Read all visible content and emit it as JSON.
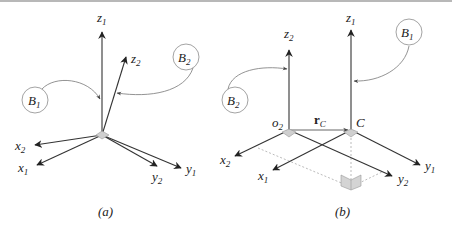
{
  "figure": {
    "panels": [
      {
        "id": "a",
        "caption": "(a)",
        "bodies": [
          {
            "label": "B",
            "sub": "1"
          },
          {
            "label": "B",
            "sub": "2"
          }
        ],
        "axes": {
          "z1": {
            "label": "z",
            "sub": "1"
          },
          "z2": {
            "label": "z",
            "sub": "2"
          },
          "x1": {
            "label": "x",
            "sub": "1"
          },
          "x2": {
            "label": "x",
            "sub": "2"
          },
          "y1": {
            "label": "y",
            "sub": "1"
          },
          "y2": {
            "label": "y",
            "sub": "2"
          }
        }
      },
      {
        "id": "b",
        "caption": "(b)",
        "bodies": [
          {
            "label": "B",
            "sub": "1"
          },
          {
            "label": "B",
            "sub": "2"
          }
        ],
        "points": {
          "o2": {
            "label": "o",
            "sub": "2"
          },
          "C": {
            "label": "C"
          }
        },
        "vector": {
          "label": "r",
          "sub": "C"
        },
        "axes": {
          "z1": {
            "label": "z",
            "sub": "1"
          },
          "z2": {
            "label": "z",
            "sub": "2"
          },
          "x1": {
            "label": "x",
            "sub": "1"
          },
          "x2": {
            "label": "x",
            "sub": "2"
          },
          "y1": {
            "label": "y",
            "sub": "1"
          },
          "y2": {
            "label": "y",
            "sub": "2"
          }
        }
      }
    ],
    "colors": {
      "axis": "#333333",
      "circle": "#9a9a9a",
      "dashed": "#a0a0a0",
      "origin_fill": "#cccccc"
    }
  }
}
